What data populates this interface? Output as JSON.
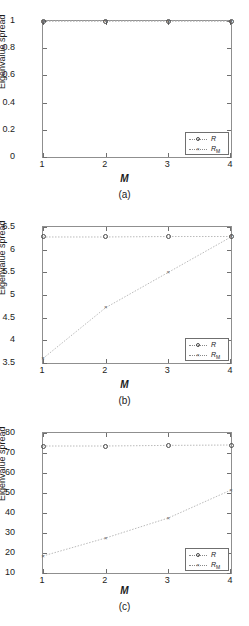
{
  "figure": {
    "axis_title_y": "Eigenvalue spread",
    "axis_title_x": "M",
    "legend_labels": {
      "r": "R",
      "rm": "R",
      "rm_sub": "M"
    },
    "marker_glyph_x": "×"
  },
  "panels": [
    {
      "id": "a",
      "caption": "(a)",
      "chart_data": {
        "type": "line",
        "title": "(a)",
        "xlabel": "M",
        "ylabel": "Eigenvalue spread",
        "x": [
          1,
          2,
          3,
          4
        ],
        "xlim": [
          1,
          4
        ],
        "ylim": [
          0,
          1
        ],
        "xticks": [
          "1",
          "2",
          "3",
          "4"
        ],
        "yticks": [
          "0",
          "0.2",
          "0.4",
          "0.6",
          "0.8",
          "1"
        ],
        "ytick_values": [
          0,
          0.2,
          0.4,
          0.6,
          0.8,
          1
        ],
        "grid": false,
        "legend_position": "lower right",
        "series": [
          {
            "name": "R",
            "marker": "circle",
            "values": [
              1.0,
              1.0,
              1.0,
              1.0
            ]
          },
          {
            "name": "R_M",
            "marker": "x",
            "values": [
              1.0,
              1.0,
              1.0,
              1.0
            ]
          }
        ]
      }
    },
    {
      "id": "b",
      "caption": "(b)",
      "chart_data": {
        "type": "line",
        "title": "(b)",
        "xlabel": "M",
        "ylabel": "Eigenvalue spread",
        "x": [
          1,
          2,
          3,
          4
        ],
        "xlim": [
          1,
          4
        ],
        "ylim": [
          3.5,
          6.5
        ],
        "xticks": [
          "1",
          "2",
          "3",
          "4"
        ],
        "yticks": [
          "3.5",
          "4",
          "4.5",
          "5",
          "5.5",
          "6",
          "6.5"
        ],
        "ytick_values": [
          3.5,
          4,
          4.5,
          5,
          5.5,
          6,
          6.5
        ],
        "grid": false,
        "legend_position": "lower right",
        "series": [
          {
            "name": "R",
            "marker": "circle",
            "values": [
              6.28,
              6.28,
              6.29,
              6.29
            ]
          },
          {
            "name": "R_M",
            "marker": "x",
            "values": [
              3.6,
              4.72,
              5.5,
              6.28
            ]
          }
        ]
      }
    },
    {
      "id": "c",
      "caption": "(c)",
      "chart_data": {
        "type": "line",
        "title": "(c)",
        "xlabel": "M",
        "ylabel": "Eigenvalue spread",
        "x": [
          1,
          2,
          3,
          4
        ],
        "xlim": [
          1,
          4
        ],
        "ylim": [
          10,
          80
        ],
        "xticks": [
          "1",
          "2",
          "3",
          "4"
        ],
        "yticks": [
          "10",
          "20",
          "30",
          "40",
          "50",
          "60",
          "70",
          "80"
        ],
        "ytick_values": [
          10,
          20,
          30,
          40,
          50,
          60,
          70,
          80
        ],
        "grid": false,
        "legend_position": "lower right",
        "series": [
          {
            "name": "R",
            "marker": "circle",
            "values": [
              73.5,
              73.5,
              73.8,
              74.0
            ]
          },
          {
            "name": "R_M",
            "marker": "x",
            "values": [
              18.5,
              27.5,
              37.5,
              51.5
            ]
          }
        ]
      }
    }
  ]
}
